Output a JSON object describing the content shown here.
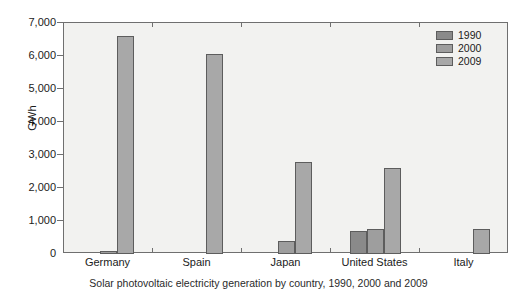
{
  "chart_data": {
    "type": "bar",
    "title": "",
    "xlabel": "",
    "ylabel": "GWh",
    "ylim": [
      0,
      7000
    ],
    "ytick_values": [
      0,
      1000,
      2000,
      3000,
      4000,
      5000,
      6000,
      7000
    ],
    "ytick_labels": [
      "0",
      "1,000",
      "2,000",
      "3,000",
      "4,000",
      "5,000",
      "6,000",
      "7,000"
    ],
    "grid": false,
    "legend_position": "top-right",
    "categories": [
      "Germany",
      "Spain",
      "Japan",
      "United States",
      "Italy"
    ],
    "series": [
      {
        "name": "1990",
        "color": "#8a8a8a",
        "values": [
          0,
          0,
          0,
          700,
          0
        ]
      },
      {
        "name": "2000",
        "color": "#9e9e9e",
        "values": [
          100,
          0,
          400,
          750,
          0
        ]
      },
      {
        "name": "2009",
        "color": "#a8a8a8",
        "values": [
          6600,
          6050,
          2800,
          2600,
          750
        ]
      }
    ]
  },
  "caption": {
    "text": "Solar photovoltaic electricity generation by country, 1990, 2000 and 2009"
  },
  "legend": {
    "items": [
      {
        "label": "1990"
      },
      {
        "label": "2000"
      },
      {
        "label": "2009"
      }
    ]
  },
  "axes": {
    "y_title": "GWh"
  }
}
